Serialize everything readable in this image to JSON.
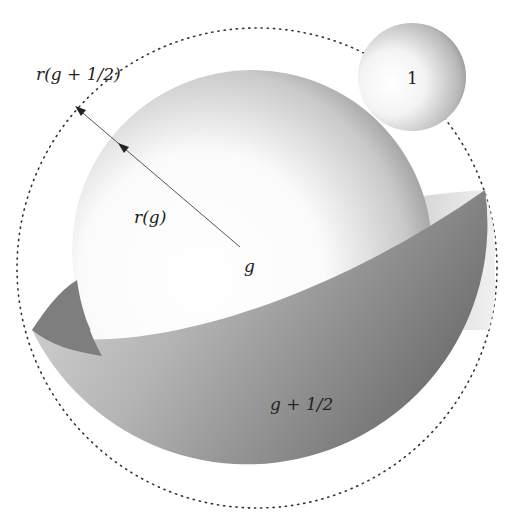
{
  "figure": {
    "labels": {
      "outer_radius": "r(g + 1/2)",
      "inner_radius": "r(g)",
      "inner_center": "g",
      "shell": "g + 1/2",
      "unit_sphere": "1"
    },
    "colors": {
      "background": "#ffffff",
      "sphere_light": "#ffffff",
      "sphere_dark": "#7a7a7a",
      "shell_dark": "#6e6e6e",
      "dotted_circle": "#333333",
      "arrow": "#444444",
      "text": "#222222"
    },
    "geometry": {
      "outer_circle": {
        "cx": 257,
        "cy": 268,
        "r": 240
      },
      "inner_sphere": {
        "cx": 252,
        "cy": 250,
        "r": 180
      },
      "unit_sphere": {
        "cx": 412,
        "cy": 77,
        "r": 54
      },
      "radius_arrow": {
        "x1": 240,
        "y1": 247,
        "x2": 75,
        "y2": 106
      }
    }
  }
}
